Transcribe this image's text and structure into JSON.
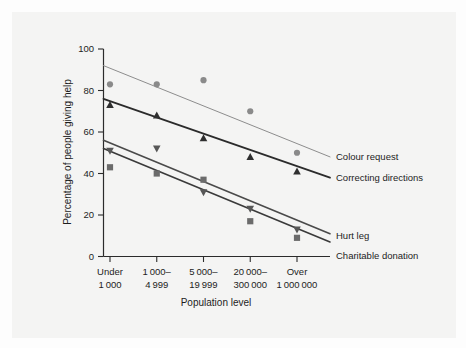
{
  "figure": {
    "background_color": "#f4f4f3",
    "page_color": "#fdfdfd"
  },
  "chart_data": {
    "type": "scatter",
    "title": "",
    "subtitle": "",
    "xlabel": "Population level",
    "ylabel": "Percentage of people giving help",
    "ylim": [
      0,
      100
    ],
    "yticks": [
      0,
      20,
      40,
      60,
      80,
      100
    ],
    "ytick_labels": [
      "0",
      "20",
      "40",
      "60",
      "80",
      "100"
    ],
    "grid": false,
    "legend_position": "inline-right",
    "categories": [
      "Under 1000",
      "1000–4999",
      "5000–19999",
      "20000–300000",
      "Over 1000000"
    ],
    "category_lines": [
      [
        "Under",
        "1 000"
      ],
      [
        "1 000–",
        "4 999"
      ],
      [
        "5 000–",
        "19 999"
      ],
      [
        "20 000–",
        "300 000"
      ],
      [
        "Over",
        "1 000 000"
      ]
    ],
    "series": [
      {
        "name": "Colour request",
        "label": "Colour request",
        "marker": "circle",
        "color": "#8a8a8a",
        "line_color": "#8d8d8d",
        "line_width": 1.0,
        "values": [
          83,
          83,
          85,
          70,
          50
        ],
        "trend_start": 92,
        "trend_end": 48
      },
      {
        "name": "Correcting directions",
        "label": "Correcting directions",
        "marker": "triangle-up",
        "color": "#2f2f2f",
        "line_color": "#2b2b2b",
        "line_width": 1.8,
        "values": [
          73,
          68,
          57,
          48,
          41
        ],
        "trend_start": 76,
        "trend_end": 38
      },
      {
        "name": "Hurt leg",
        "label": "Hurt leg",
        "marker": "triangle-down",
        "color": "#575757",
        "line_color": "#4a4a4a",
        "line_width": 1.6,
        "values": [
          51,
          52,
          31,
          23,
          13
        ],
        "trend_start": 56,
        "trend_end": 11
      },
      {
        "name": "Charitable donation",
        "label": "Charitable donation",
        "marker": "square",
        "color": "#6b6b6b",
        "line_color": "#3a3a3a",
        "line_width": 1.6,
        "values": [
          43,
          40,
          37,
          17,
          9
        ],
        "trend_start": 52,
        "trend_end": 7
      }
    ]
  }
}
